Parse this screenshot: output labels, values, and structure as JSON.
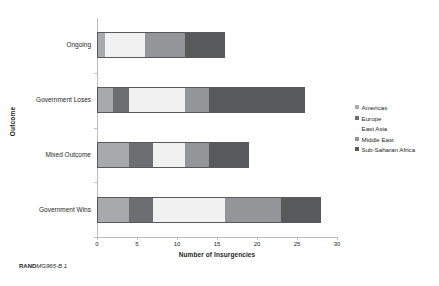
{
  "chart_data": {
    "type": "bar",
    "orientation": "horizontal",
    "stacked": true,
    "title": "",
    "xlabel": "Number of Insurgencies",
    "ylabel": "Outcome",
    "xlim": [
      0,
      30
    ],
    "xticks": [
      0,
      5,
      10,
      15,
      20,
      25,
      30
    ],
    "xticklabels": [
      "0",
      "5",
      "10",
      "15",
      "20",
      "25",
      "30"
    ],
    "grid": false,
    "legend_position": "right",
    "categories": [
      "Ongoing",
      "Government Loses",
      "Mixed Outcome",
      "Government Wins"
    ],
    "series": [
      {
        "name": "Americas",
        "color": "#a7a9ac",
        "values": [
          1,
          2,
          4,
          4
        ]
      },
      {
        "name": "Europe",
        "color": "#6d6e71",
        "values": [
          0,
          2,
          3,
          3
        ]
      },
      {
        "name": "East Asia",
        "color": "#f1f1f2",
        "values": [
          5,
          7,
          4,
          9
        ]
      },
      {
        "name": "Middle East",
        "color": "#939598",
        "values": [
          5,
          3,
          3,
          7
        ]
      },
      {
        "name": "Sub-Saharan Africa",
        "color": "#58595b",
        "values": [
          5,
          12,
          5,
          5
        ]
      }
    ],
    "totals": [
      16,
      26,
      19,
      28
    ]
  },
  "legend": {
    "items": [
      {
        "label": "Americas"
      },
      {
        "label": "Europe"
      },
      {
        "label": "East Asia"
      },
      {
        "label": "Middle East"
      },
      {
        "label": "Sub-Saharan Africa"
      }
    ]
  },
  "footer": {
    "brand": "RAND",
    "figure_id": "MG965-B.1"
  }
}
